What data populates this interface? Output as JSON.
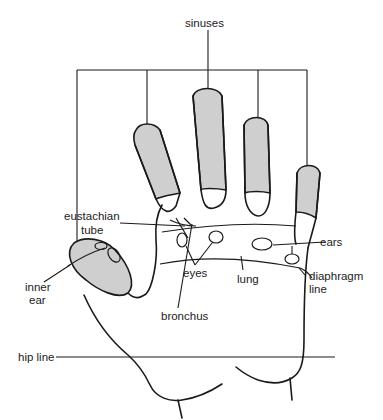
{
  "figure": {
    "colors": {
      "shaded": "#cfcfcf",
      "line": "#1a1a1a",
      "background": "#ffffff"
    }
  },
  "labels": {
    "sinuses": "sinuses",
    "eustachian_1": "eustachian",
    "eustachian_2": "tube",
    "inner_ear_1": "inner",
    "inner_ear_2": "ear",
    "eyes": "eyes",
    "bronchus": "bronchus",
    "lung": "lung",
    "ears": "ears",
    "diaphragm_1": "diaphragm",
    "diaphragm_2": "line",
    "hip_line": "hip line"
  }
}
